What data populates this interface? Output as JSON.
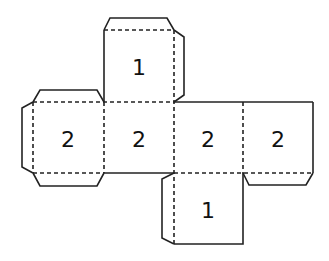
{
  "diagram": {
    "type": "cube-net",
    "faces": [
      {
        "id": "top",
        "label": "1"
      },
      {
        "id": "row-1",
        "label": "2"
      },
      {
        "id": "row-2",
        "label": "2"
      },
      {
        "id": "row-3",
        "label": "2"
      },
      {
        "id": "row-4",
        "label": "2"
      },
      {
        "id": "bottom",
        "label": "1"
      }
    ],
    "colors": {
      "line": "#222222",
      "background": "#ffffff"
    }
  }
}
